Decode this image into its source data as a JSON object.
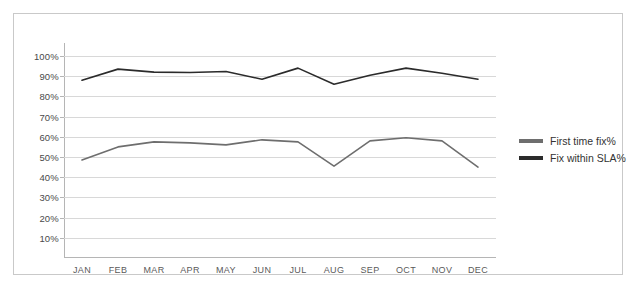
{
  "chart_data": {
    "type": "line",
    "title": "",
    "subtitle": "",
    "xlabel": "",
    "ylabel": "",
    "grid": true,
    "legend_position": "right",
    "ylim": [
      0,
      100
    ],
    "y_ticks": [
      "10%",
      "20%",
      "30%",
      "40%",
      "50%",
      "60%",
      "70%",
      "80%",
      "90%",
      "100%"
    ],
    "y_tick_values": [
      10,
      20,
      30,
      40,
      50,
      60,
      70,
      80,
      90,
      100
    ],
    "categories": [
      "JAN",
      "FEB",
      "MAR",
      "APR",
      "MAY",
      "JUN",
      "JUL",
      "AUG",
      "SEP",
      "OCT",
      "NOV",
      "DEC"
    ],
    "series": [
      {
        "name": "First time fix%",
        "color": "#6e6e6e",
        "values": [
          48.5,
          55,
          57.5,
          57,
          56,
          58.5,
          57.5,
          45.5,
          58,
          59.5,
          58,
          45
        ]
      },
      {
        "name": "Fix within SLA%",
        "color": "#2b2b2b",
        "values": [
          88,
          93.5,
          92,
          91.8,
          92.3,
          88.5,
          94,
          86,
          90.5,
          94,
          91.5,
          88.5
        ]
      }
    ]
  },
  "legend": {
    "items": [
      {
        "label": "First time fix%",
        "color": "#6e6e6e"
      },
      {
        "label": "Fix within SLA%",
        "color": "#2b2b2b"
      }
    ]
  },
  "colors": {
    "frame_border": "#c9c9c9",
    "gridline": "#d8d8d8",
    "axis": "#b5b5b5",
    "background": "#ffffff",
    "tick_text": "#4a4a4a"
  }
}
